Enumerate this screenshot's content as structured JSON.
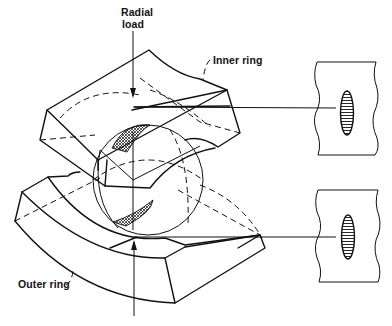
{
  "figure": {
    "type": "technical-diagram",
    "labels": {
      "radial_load": [
        "Radial",
        "load"
      ],
      "inner_ring": "Inner ring",
      "outer_ring": "Outer ring"
    },
    "insets": [
      {
        "name": "inner-ring-contact-ellipse",
        "position": "upper-right"
      },
      {
        "name": "outer-ring-contact-ellipse",
        "position": "lower-right"
      }
    ],
    "colors": {
      "ink": "#111111",
      "background": "#ffffff"
    }
  }
}
